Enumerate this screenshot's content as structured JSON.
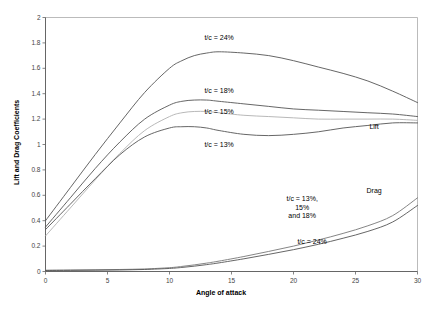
{
  "chart_data": {
    "type": "line",
    "title": "",
    "xlabel": "Angle of attack",
    "ylabel": "Lift and Drag Coefficients",
    "xlim": [
      0,
      30
    ],
    "ylim": [
      0,
      2
    ],
    "xticks": [
      0,
      5,
      10,
      15,
      20,
      25,
      30
    ],
    "xtick_labels": [
      "0",
      "5",
      "10",
      "15",
      "20",
      "25",
      "30"
    ],
    "yticks": [
      0,
      0.2,
      0.4,
      0.6,
      0.8,
      1,
      1.2,
      1.4,
      1.6,
      1.8,
      2
    ],
    "ytick_labels": [
      "0",
      "0.2",
      "0.4",
      "0.6",
      "0.8",
      "1",
      "1.2",
      "1.4",
      "1.6",
      "1.8",
      "2"
    ],
    "grid": false,
    "legend": "none",
    "x": [
      0,
      2,
      4,
      6,
      8,
      10,
      11,
      12,
      13,
      14,
      16,
      18,
      20,
      22,
      24,
      26,
      28,
      30
    ],
    "series": [
      {
        "name": "Lift t/c = 24%",
        "quantity": "lift",
        "tc": "24%",
        "color": "#555555",
        "values": [
          0.4,
          0.66,
          0.92,
          1.17,
          1.41,
          1.6,
          1.66,
          1.7,
          1.72,
          1.73,
          1.72,
          1.7,
          1.66,
          1.61,
          1.56,
          1.5,
          1.42,
          1.33
        ]
      },
      {
        "name": "Lift t/c = 18%",
        "quantity": "lift",
        "tc": "18%",
        "color": "#555555",
        "values": [
          0.35,
          0.58,
          0.81,
          1.02,
          1.2,
          1.31,
          1.34,
          1.35,
          1.35,
          1.34,
          1.32,
          1.3,
          1.28,
          1.27,
          1.26,
          1.25,
          1.24,
          1.22
        ]
      },
      {
        "name": "Lift t/c = 15%",
        "quantity": "lift",
        "tc": "15%",
        "color": "#b0b0b0",
        "values": [
          0.28,
          0.5,
          0.72,
          0.93,
          1.11,
          1.22,
          1.25,
          1.26,
          1.26,
          1.25,
          1.23,
          1.22,
          1.21,
          1.2,
          1.2,
          1.2,
          1.2,
          1.19
        ]
      },
      {
        "name": "Lift t/c = 13%",
        "quantity": "lift",
        "tc": "13%",
        "color": "#555555",
        "values": [
          0.33,
          0.53,
          0.73,
          0.92,
          1.06,
          1.13,
          1.14,
          1.14,
          1.13,
          1.11,
          1.08,
          1.07,
          1.08,
          1.1,
          1.13,
          1.15,
          1.17,
          1.17
        ]
      },
      {
        "name": "Drag t/c = 13%, 15% and 18%",
        "quantity": "drag",
        "tc": "13%, 15% and 18%",
        "color": "#777777",
        "values": [
          0.01,
          0.012,
          0.014,
          0.016,
          0.02,
          0.03,
          0.04,
          0.052,
          0.066,
          0.082,
          0.118,
          0.158,
          0.2,
          0.248,
          0.3,
          0.36,
          0.44,
          0.58
        ]
      },
      {
        "name": "Drag t/c = 24%",
        "quantity": "drag",
        "tc": "24%",
        "color": "#555555",
        "values": [
          0.008,
          0.009,
          0.01,
          0.012,
          0.016,
          0.024,
          0.032,
          0.042,
          0.054,
          0.068,
          0.1,
          0.135,
          0.172,
          0.214,
          0.262,
          0.316,
          0.39,
          0.52
        ]
      }
    ],
    "annotations": [
      {
        "id": "tc24-lift",
        "text": "t/c = 24%",
        "x": 14.0,
        "y": 1.84
      },
      {
        "id": "tc18-lift",
        "text": "t/c = 18%",
        "x": 14.0,
        "y": 1.42
      },
      {
        "id": "tc15-lift",
        "text": "t/c = 15%",
        "x": 14.0,
        "y": 1.255
      },
      {
        "id": "tc13-lift",
        "text": "t/c = 13%",
        "x": 14.0,
        "y": 1.0
      },
      {
        "id": "lift-label",
        "text": "Lift",
        "x": 26.5,
        "y": 1.14
      },
      {
        "id": "drag-label",
        "text": "Drag",
        "x": 26.5,
        "y": 0.63
      },
      {
        "id": "drag-group",
        "text": "t/c = 13%,\n15%\nand 18%",
        "x": 20.7,
        "y": 0.5
      },
      {
        "id": "tc24-drag",
        "text": "t/c = 24%",
        "x": 21.5,
        "y": 0.235
      }
    ]
  }
}
